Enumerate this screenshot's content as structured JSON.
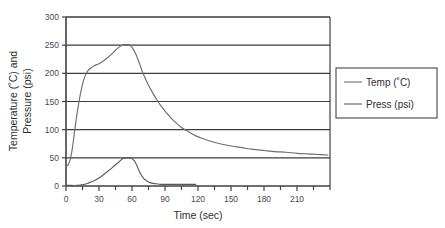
{
  "chart_data": {
    "type": "line",
    "title": "",
    "xlabel": "Time (sec)",
    "ylabel_line1": "Temperature (˚C) and",
    "ylabel_line2": "Pressure (psi)",
    "xlim": [
      0,
      240
    ],
    "ylim": [
      0,
      300
    ],
    "xticks": [
      0,
      30,
      60,
      90,
      120,
      150,
      180,
      210
    ],
    "xtick_labels": [
      "0",
      "30",
      "60",
      "90",
      "120",
      "150",
      "180",
      "210"
    ],
    "xminor_step": 15,
    "yticks": [
      0,
      50,
      100,
      150,
      200,
      250,
      300
    ],
    "ytick_labels": [
      "0",
      "50",
      "100",
      "150",
      "200",
      "250",
      "300"
    ],
    "grid": "horizontal",
    "legend_position": "right",
    "series": [
      {
        "name": "Temp (˚C)",
        "color": "#6e6e6e",
        "x": [
          0,
          2,
          4,
          6,
          8,
          10,
          12,
          14,
          16,
          18,
          20,
          23,
          26,
          30,
          34,
          38,
          42,
          46,
          50,
          53,
          56,
          58,
          60,
          63,
          66,
          70,
          74,
          78,
          82,
          86,
          90,
          95,
          100,
          105,
          110,
          118,
          126,
          134,
          142,
          150,
          160,
          170,
          180,
          190,
          200,
          210,
          220,
          230,
          238
        ],
        "y": [
          35,
          38,
          48,
          70,
          100,
          128,
          152,
          172,
          188,
          198,
          205,
          210,
          214,
          217,
          222,
          228,
          235,
          243,
          249,
          251,
          251,
          250,
          246,
          236,
          222,
          200,
          183,
          168,
          155,
          143,
          133,
          122,
          112,
          104,
          98,
          89,
          83,
          78,
          74,
          71,
          68,
          65,
          63,
          61,
          60,
          58,
          57,
          56,
          55
        ]
      },
      {
        "name": "Press (psi)",
        "color": "#5a5a5a",
        "x": [
          0,
          5,
          10,
          14,
          17,
          20,
          24,
          28,
          32,
          36,
          40,
          44,
          47,
          50,
          52,
          55,
          58,
          60,
          62,
          64,
          66,
          68,
          70,
          72,
          75,
          78,
          82,
          86,
          90,
          96,
          102,
          110,
          118
        ],
        "y": [
          1,
          1,
          1,
          2,
          3,
          5,
          8,
          12,
          17,
          23,
          29,
          36,
          41,
          46,
          49,
          50,
          50,
          49,
          45,
          38,
          29,
          21,
          15,
          11,
          7,
          5,
          4,
          3,
          3,
          3,
          3,
          3,
          3
        ]
      }
    ]
  },
  "legend": {
    "items": [
      {
        "label": "Temp (˚C)"
      },
      {
        "label": "Press (psi)"
      }
    ]
  },
  "colors": {
    "axis": "#404040",
    "grid": "#3d3d3d",
    "temp": "#6e6e6e",
    "press": "#5a5a5a",
    "legend_border": "#555555",
    "background": "#ffffff"
  }
}
